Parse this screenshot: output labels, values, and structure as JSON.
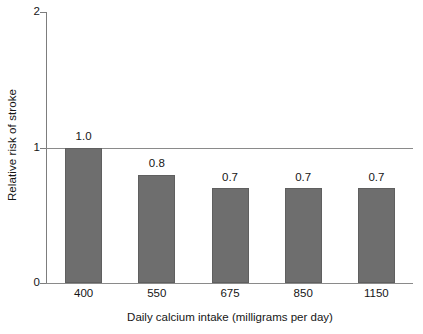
{
  "chart_data": {
    "type": "bar",
    "title": "",
    "subtitle": "",
    "categories": [
      "400",
      "550",
      "675",
      "850",
      "1150"
    ],
    "values": [
      1.0,
      0.8,
      0.7,
      0.7,
      0.7
    ],
    "data_labels": [
      "1.0",
      "0.8",
      "0.7",
      "0.7",
      "0.7"
    ],
    "xlabel": "Daily calcium intake (milligrams per day)",
    "ylabel": "Relative risk of stroke",
    "ylim": [
      0,
      2
    ],
    "yticks": [
      0,
      1,
      2
    ],
    "ytick_labels": [
      "0",
      "1",
      "2"
    ],
    "xticks_visible": false,
    "grid": false,
    "reference_line": 1.0,
    "legend": null,
    "legend_position": "none",
    "bar_color": "#6e6e6e",
    "axis_color": "#8a8a8a",
    "text_color": "#161616",
    "background_color": "#ffffff"
  }
}
